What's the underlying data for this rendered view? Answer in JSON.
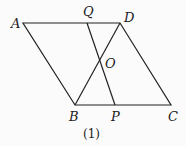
{
  "diagram": {
    "type": "parallelogram-geometry",
    "caption": "(1)",
    "points": {
      "A": {
        "label": "A",
        "x": 23,
        "y": 23
      },
      "D": {
        "label": "D",
        "x": 120,
        "y": 23
      },
      "B": {
        "label": "B",
        "x": 75,
        "y": 105
      },
      "C": {
        "label": "C",
        "x": 171,
        "y": 105
      },
      "Q": {
        "label": "Q",
        "x": 87,
        "y": 23
      },
      "P": {
        "label": "P",
        "x": 115,
        "y": 105
      },
      "O": {
        "label": "O",
        "x": 100,
        "y": 61
      }
    },
    "segments": [
      "AD",
      "DC",
      "CB",
      "BA",
      "BD",
      "QP"
    ],
    "line_color": "#222222"
  }
}
